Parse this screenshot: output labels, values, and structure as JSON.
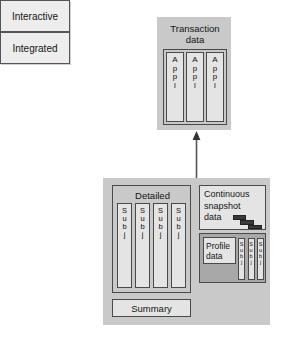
{
  "diagram": {
    "colors": {
      "panel_gray": "#c9c9c9",
      "box_light": "#e4e4e4",
      "label_box": "#ededed",
      "profile_gray": "#a8a8a8",
      "stroke": "#4a4a4a",
      "stair_dark": "#3a3a3a",
      "text": "#141414",
      "background": "#ffffff"
    },
    "categories": [
      {
        "id": "interactive",
        "label": "Interactive"
      },
      {
        "id": "integrated",
        "label": "Integrated"
      }
    ],
    "interactive_level": {
      "panel_title": "Transaction data",
      "panel_title_lines": [
        "Transaction",
        "data"
      ],
      "columns": [
        {
          "label": "Appl",
          "letters": [
            "A",
            "p",
            "p",
            "l"
          ]
        },
        {
          "label": "Appl",
          "letters": [
            "A",
            "p",
            "p",
            "l"
          ]
        },
        {
          "label": "Appl",
          "letters": [
            "A",
            "p",
            "p",
            "l"
          ]
        }
      ]
    },
    "integrated_level": {
      "detailed": {
        "title": "Detailed",
        "columns": [
          {
            "label": "Subj",
            "letters": [
              "S",
              "u",
              "b",
              "j"
            ]
          },
          {
            "label": "Subj",
            "letters": [
              "S",
              "u",
              "b",
              "j"
            ]
          },
          {
            "label": "Subj",
            "letters": [
              "S",
              "u",
              "b",
              "j"
            ]
          },
          {
            "label": "Subj",
            "letters": [
              "S",
              "u",
              "b",
              "j"
            ]
          }
        ]
      },
      "summary": {
        "title": "Summary"
      },
      "snapshot": {
        "title": "Continuous snapshot data",
        "title_lines": [
          "Continuous",
          "snapshot",
          "data"
        ],
        "marker_count": 3
      },
      "profile": {
        "title": "Profile data",
        "title_lines": [
          "Profile",
          "data"
        ],
        "columns": [
          {
            "label": "Subj",
            "letters": [
              "S",
              "u",
              "b",
              "j"
            ]
          },
          {
            "label": "Subj",
            "letters": [
              "S",
              "u",
              "b",
              "j"
            ]
          },
          {
            "label": "Subj",
            "letters": [
              "S",
              "u",
              "b",
              "j"
            ]
          }
        ]
      }
    },
    "connector": {
      "name": "upward-arrow",
      "from": "integrated-panel",
      "to": "transaction-panel",
      "direction": "up"
    }
  }
}
